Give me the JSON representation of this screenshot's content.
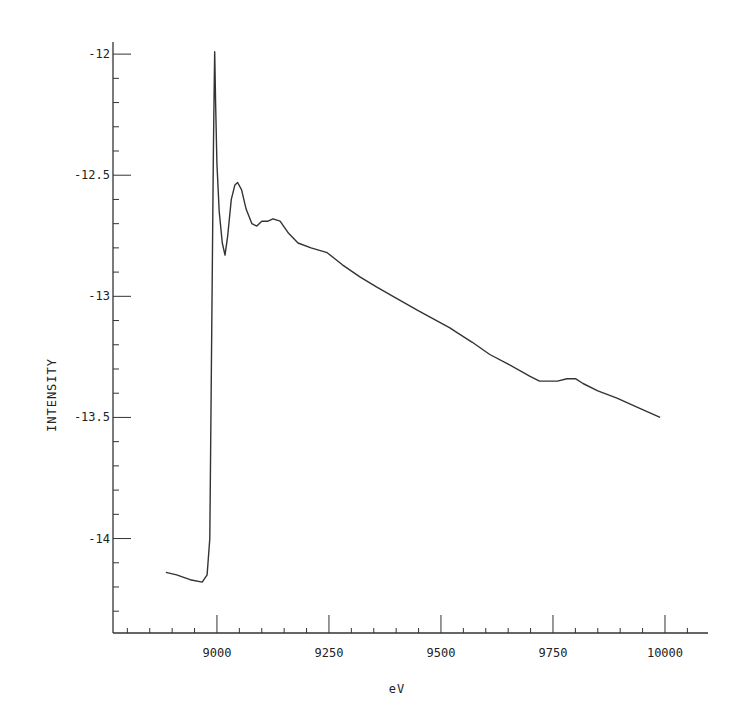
{
  "chart_data": {
    "type": "line",
    "title": "",
    "xlabel": "eV",
    "ylabel": "INTENSITY",
    "xlim": [
      8768,
      10096
    ],
    "ylim": [
      -14.39,
      -11.95
    ],
    "grid": false,
    "legend": null,
    "x_ticks": [
      9000,
      9250,
      9500,
      9750,
      10000
    ],
    "x_tick_labels": [
      "9000",
      "9250",
      "9500",
      "9750",
      "10000"
    ],
    "x_minor_step": 50,
    "y_ticks": [
      -12,
      -12.5,
      -13,
      -13.5,
      -14
    ],
    "y_tick_labels": [
      "-12",
      "-12.5",
      "-13",
      "-13.5",
      "-14"
    ],
    "y_minor_step": 0.1,
    "series": [
      {
        "name": "XAFS spectrum",
        "color": "#333333",
        "x": [
          8886,
          8910,
          8940,
          8967,
          8978,
          8984,
          8986,
          8988,
          8990,
          8992,
          8994,
          8995,
          8997,
          9000,
          9005,
          9012,
          9018,
          9024,
          9032,
          9040,
          9046,
          9055,
          9065,
          9078,
          9089,
          9100,
          9114,
          9125,
          9141,
          9160,
          9181,
          9210,
          9246,
          9280,
          9319,
          9355,
          9393,
          9450,
          9520,
          9536,
          9570,
          9609,
          9650,
          9699,
          9720,
          9737,
          9760,
          9781,
          9800,
          9817,
          9850,
          9893,
          9940,
          9989
        ],
        "y": [
          -14.14,
          -14.15,
          -14.17,
          -14.18,
          -14.15,
          -14.0,
          -13.6,
          -13.2,
          -12.8,
          -12.4,
          -12.1,
          -11.99,
          -12.2,
          -12.45,
          -12.65,
          -12.78,
          -12.83,
          -12.75,
          -12.6,
          -12.54,
          -12.53,
          -12.56,
          -12.64,
          -12.7,
          -12.71,
          -12.69,
          -12.69,
          -12.68,
          -12.69,
          -12.74,
          -12.78,
          -12.8,
          -12.82,
          -12.87,
          -12.92,
          -12.96,
          -13.0,
          -13.06,
          -13.13,
          -13.15,
          -13.19,
          -13.24,
          -13.28,
          -13.33,
          -13.35,
          -13.35,
          -13.35,
          -13.34,
          -13.34,
          -13.36,
          -13.39,
          -13.42,
          -13.46,
          -13.5
        ]
      }
    ]
  }
}
